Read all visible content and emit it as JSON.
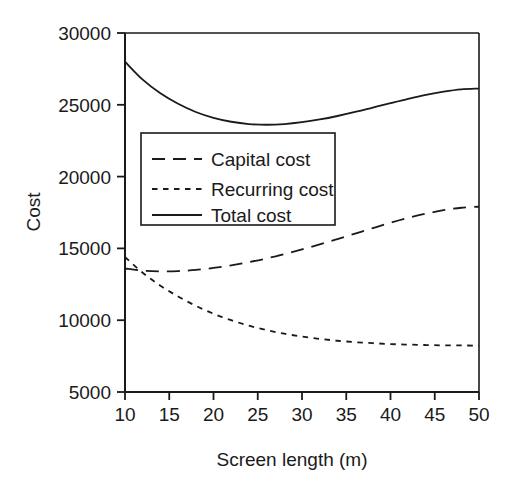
{
  "chart_data": {
    "type": "line",
    "title": "",
    "xlabel": "Screen length (m)",
    "ylabel": "Cost",
    "xlim": [
      10,
      50
    ],
    "ylim": [
      5000,
      30000
    ],
    "xticks": [
      10,
      15,
      20,
      25,
      30,
      35,
      40,
      45,
      50
    ],
    "xtick_labels": [
      "10",
      "15",
      "20",
      "25",
      "30",
      "35",
      "40",
      "45",
      "50"
    ],
    "yticks": [
      5000,
      10000,
      15000,
      20000,
      25000,
      30000
    ],
    "ytick_labels": [
      "5000",
      "10000",
      "15000",
      "20000",
      "25000",
      "30000"
    ],
    "grid": false,
    "legend_position": "upper-left-inside",
    "line_color": "#1a1a1a",
    "background": "#ffffff",
    "x": [
      10,
      12,
      14,
      16,
      18,
      20,
      22,
      24,
      26,
      28,
      30,
      32,
      34,
      36,
      38,
      40,
      42,
      44,
      46,
      48,
      50
    ],
    "series": [
      {
        "name": "Capital cost",
        "style": "long-dash",
        "values": [
          13600,
          13450,
          13400,
          13420,
          13500,
          13640,
          13820,
          14040,
          14300,
          14600,
          14930,
          15280,
          15650,
          16030,
          16410,
          16780,
          17120,
          17420,
          17660,
          17830,
          17900
        ]
      },
      {
        "name": "Recurring cost",
        "style": "short-dash",
        "values": [
          14400,
          13300,
          12400,
          11650,
          11000,
          10450,
          10000,
          9620,
          9310,
          9060,
          8860,
          8700,
          8570,
          8470,
          8400,
          8340,
          8300,
          8270,
          8250,
          8240,
          8230
        ]
      },
      {
        "name": "Total cost",
        "style": "solid",
        "values": [
          28000,
          26750,
          25800,
          25070,
          24500,
          24090,
          23820,
          23660,
          23610,
          23660,
          23790,
          23980,
          24220,
          24500,
          24810,
          25120,
          25420,
          25690,
          25910,
          26070,
          26130
        ]
      }
    ],
    "annotations": {
      "total_min_x": 26,
      "total_min_y": 23610
    }
  },
  "legend": {
    "entries": [
      {
        "label": "Capital cost"
      },
      {
        "label": "Recurring cost"
      },
      {
        "label": "Total cost"
      }
    ]
  },
  "axes": {
    "y_title": "Cost",
    "x_title": "Screen length (m)"
  }
}
